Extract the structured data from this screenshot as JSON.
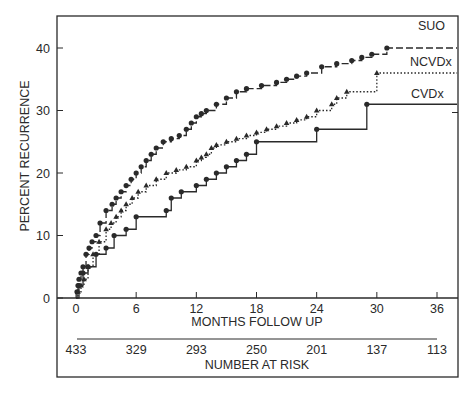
{
  "chart_data": {
    "type": "line",
    "title": "",
    "xlabel": "MONTHS FOLLOW UP",
    "ylabel": "PERCENT RECURRENCE",
    "xlim": [
      0,
      36
    ],
    "ylim": [
      0,
      40
    ],
    "x_ticks": [
      "0",
      "6",
      "12",
      "18",
      "24",
      "30",
      "36"
    ],
    "y_ticks": [
      "0",
      "10",
      "20",
      "30",
      "40"
    ],
    "grid": false,
    "risk_table": {
      "label": "NUMBER AT RISK",
      "months": [
        0,
        6,
        12,
        18,
        24,
        30,
        36
      ],
      "values": [
        "433",
        "329",
        "293",
        "250",
        "201",
        "137",
        "113"
      ]
    },
    "series": [
      {
        "name": "SUO",
        "style": "dashed",
        "marker": "circle",
        "x": [
          0,
          0.1,
          0.2,
          0.3,
          0.5,
          0.7,
          1.0,
          1.3,
          1.6,
          2.0,
          2.4,
          3.0,
          3.6,
          4.0,
          4.5,
          5.0,
          5.5,
          6.0,
          6.5,
          7.0,
          7.5,
          8.0,
          8.7,
          9.5,
          10.3,
          11.0,
          11.5,
          12.0,
          12.5,
          13.0,
          14.0,
          15.0,
          16.0,
          17.0,
          18.5,
          20.0,
          21.0,
          22.0,
          23.0,
          24.5,
          26.0,
          27.5,
          28.5,
          29.5,
          31.0,
          38
        ],
        "y": [
          0,
          1,
          2,
          3,
          4,
          5,
          7,
          8,
          9,
          10,
          12,
          14,
          15,
          16,
          17,
          18,
          19,
          20,
          21,
          22,
          23,
          24,
          25,
          25.5,
          26,
          27,
          28,
          29,
          29.5,
          30,
          31,
          32,
          33,
          33.5,
          34,
          34.5,
          35,
          35.5,
          36,
          37,
          37.5,
          38,
          38.5,
          39,
          40,
          40
        ]
      },
      {
        "name": "NCVDx",
        "style": "dotted",
        "marker": "triangle",
        "x": [
          0,
          0.2,
          0.5,
          0.8,
          1.2,
          1.7,
          2.3,
          3.0,
          3.5,
          4.0,
          4.5,
          5.0,
          5.6,
          6.2,
          7.0,
          8.0,
          9.0,
          10.0,
          11.0,
          12.0,
          12.5,
          13.0,
          13.5,
          14.0,
          15.0,
          16.0,
          17.0,
          18.0,
          19.0,
          20.0,
          21.0,
          22.0,
          23.0,
          24.0,
          25.5,
          26.0,
          27.0,
          30.0,
          38
        ],
        "y": [
          0,
          1,
          2,
          3,
          5,
          7,
          9,
          11,
          12,
          13,
          14,
          15,
          16,
          17,
          18,
          19,
          20,
          20.5,
          21,
          22,
          22.5,
          23,
          24,
          24.5,
          25,
          25.5,
          26,
          26.5,
          27,
          27.5,
          28,
          28.5,
          29,
          30,
          31,
          32,
          33,
          36,
          36
        ]
      },
      {
        "name": "CVDx",
        "style": "solid",
        "marker": "circle",
        "x": [
          0,
          0.3,
          0.7,
          1.2,
          2.0,
          3.0,
          3.8,
          5.0,
          6.0,
          9.0,
          9.5,
          10.5,
          12.0,
          13.0,
          14.0,
          15.0,
          16.0,
          17.0,
          18.0,
          24.0,
          29.0,
          38
        ],
        "y": [
          0,
          2,
          4,
          5,
          7,
          8,
          10,
          11,
          13,
          14,
          16,
          17,
          18,
          19,
          20,
          21,
          22,
          23,
          25,
          27,
          31,
          31
        ]
      }
    ],
    "legend": {
      "position": "right, inline at line ends",
      "entries": [
        "SUO",
        "NCVDx",
        "CVDx"
      ]
    }
  }
}
